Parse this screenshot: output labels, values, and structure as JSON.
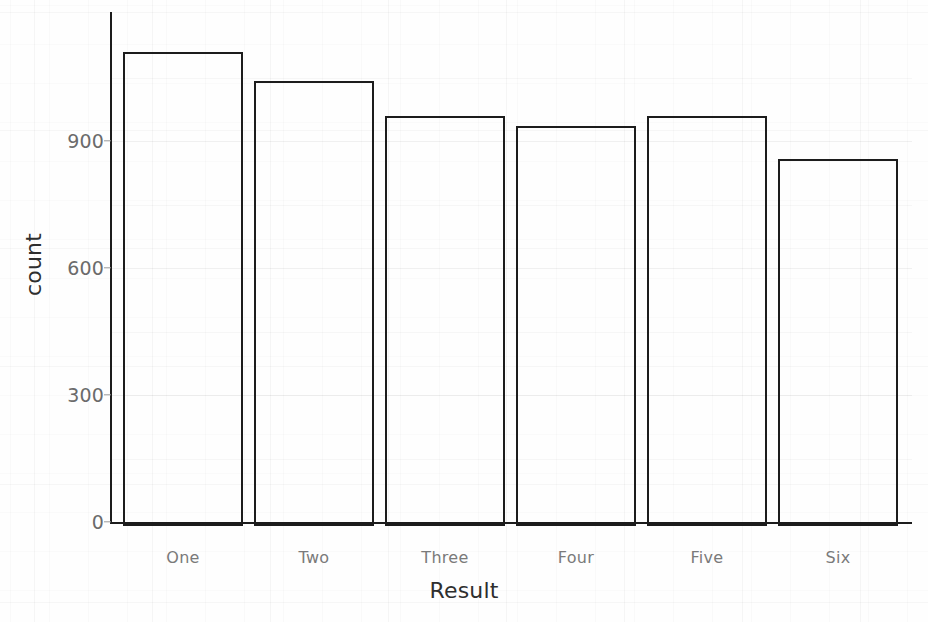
{
  "chart_data": {
    "type": "bar",
    "title": "",
    "subtitle": "",
    "xlabel": "Result",
    "ylabel": "count",
    "categories": [
      "One",
      "Two",
      "Three",
      "Four",
      "Five",
      "Six"
    ],
    "values": [
      1120,
      1051,
      969,
      945,
      969,
      867
    ],
    "series": [
      {
        "name": "count",
        "values": [
          1120,
          1051,
          969,
          945,
          969,
          867
        ]
      }
    ],
    "ylim": [
      0,
      1130
    ],
    "xlim": [
      0,
      6
    ],
    "yticks": [
      0,
      300,
      600,
      900
    ],
    "ytick_labels": [
      "0",
      "300",
      "600",
      "900"
    ],
    "xtick_labels": [
      "One",
      "Two",
      "Three",
      "Four",
      "Five",
      "Six"
    ],
    "grid": true,
    "grid_axis": "y",
    "legend": false,
    "legend_position": "none",
    "bar_fill": "none",
    "bar_outline_color": "#1c1c1c",
    "background_color": "#fefefe",
    "annotations": []
  },
  "axes": {
    "y_title": "count",
    "x_title": "Result"
  },
  "colors": {
    "outline": "#1c1c1c",
    "tick_text": "#6b6b6b",
    "xtick_text": "#7a7a7a",
    "axis_title": "#2e2e2e",
    "gridline": "#eaeaea",
    "background": "#fefefe"
  }
}
